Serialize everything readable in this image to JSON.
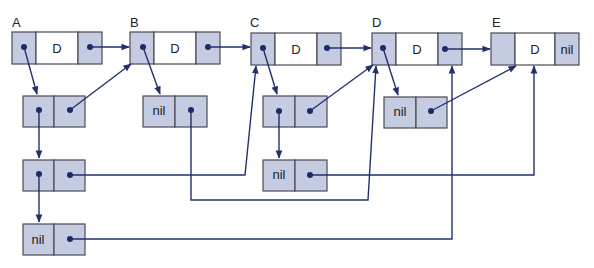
{
  "diagram": {
    "type": "linked-structure",
    "colors": {
      "shaded_cell": "#c5cce2",
      "white_cell": "#ffffff",
      "cell_border": "#4a4a55",
      "pointer": "#23306e",
      "dot": "#1c2a6b"
    },
    "top_nodes": [
      {
        "label": "A",
        "data": "D",
        "tail": "pointer"
      },
      {
        "label": "B",
        "data": "D",
        "tail": "pointer"
      },
      {
        "label": "C",
        "data": "D",
        "tail": "pointer"
      },
      {
        "label": "D",
        "data": "D",
        "tail": "pointer"
      },
      {
        "label": "E",
        "data": "D",
        "tail": "nil"
      }
    ],
    "nil_text": "nil",
    "sub_nodes": [
      {
        "id": "a1",
        "first": "pointer",
        "second": "pointer"
      },
      {
        "id": "a2",
        "first": "pointer",
        "second": "pointer"
      },
      {
        "id": "a3",
        "first": "nil",
        "second": "pointer"
      },
      {
        "id": "b1",
        "first": "nil",
        "second": "pointer"
      },
      {
        "id": "c1",
        "first": "pointer",
        "second": "pointer"
      },
      {
        "id": "c2",
        "first": "nil",
        "second": "pointer"
      },
      {
        "id": "d1",
        "first": "nil",
        "second": "pointer"
      }
    ],
    "edges": [
      {
        "from": "A.next",
        "to": "B"
      },
      {
        "from": "B.next",
        "to": "C"
      },
      {
        "from": "C.next",
        "to": "D"
      },
      {
        "from": "D.next",
        "to": "E"
      },
      {
        "from": "A.head",
        "to": "a1"
      },
      {
        "from": "a1.first",
        "to": "a2"
      },
      {
        "from": "a1.second",
        "to": "B"
      },
      {
        "from": "a2.first",
        "to": "a3"
      },
      {
        "from": "a2.second",
        "to": "C"
      },
      {
        "from": "a3.second",
        "to": "E"
      },
      {
        "from": "B.head",
        "to": "b1"
      },
      {
        "from": "b1.second",
        "to": "D"
      },
      {
        "from": "C.head",
        "to": "c1"
      },
      {
        "from": "c1.first",
        "to": "c2"
      },
      {
        "from": "c1.second",
        "to": "D"
      },
      {
        "from": "c2.second",
        "to": "E"
      },
      {
        "from": "D.head",
        "to": "d1"
      },
      {
        "from": "d1.second",
        "to": "E"
      }
    ]
  }
}
